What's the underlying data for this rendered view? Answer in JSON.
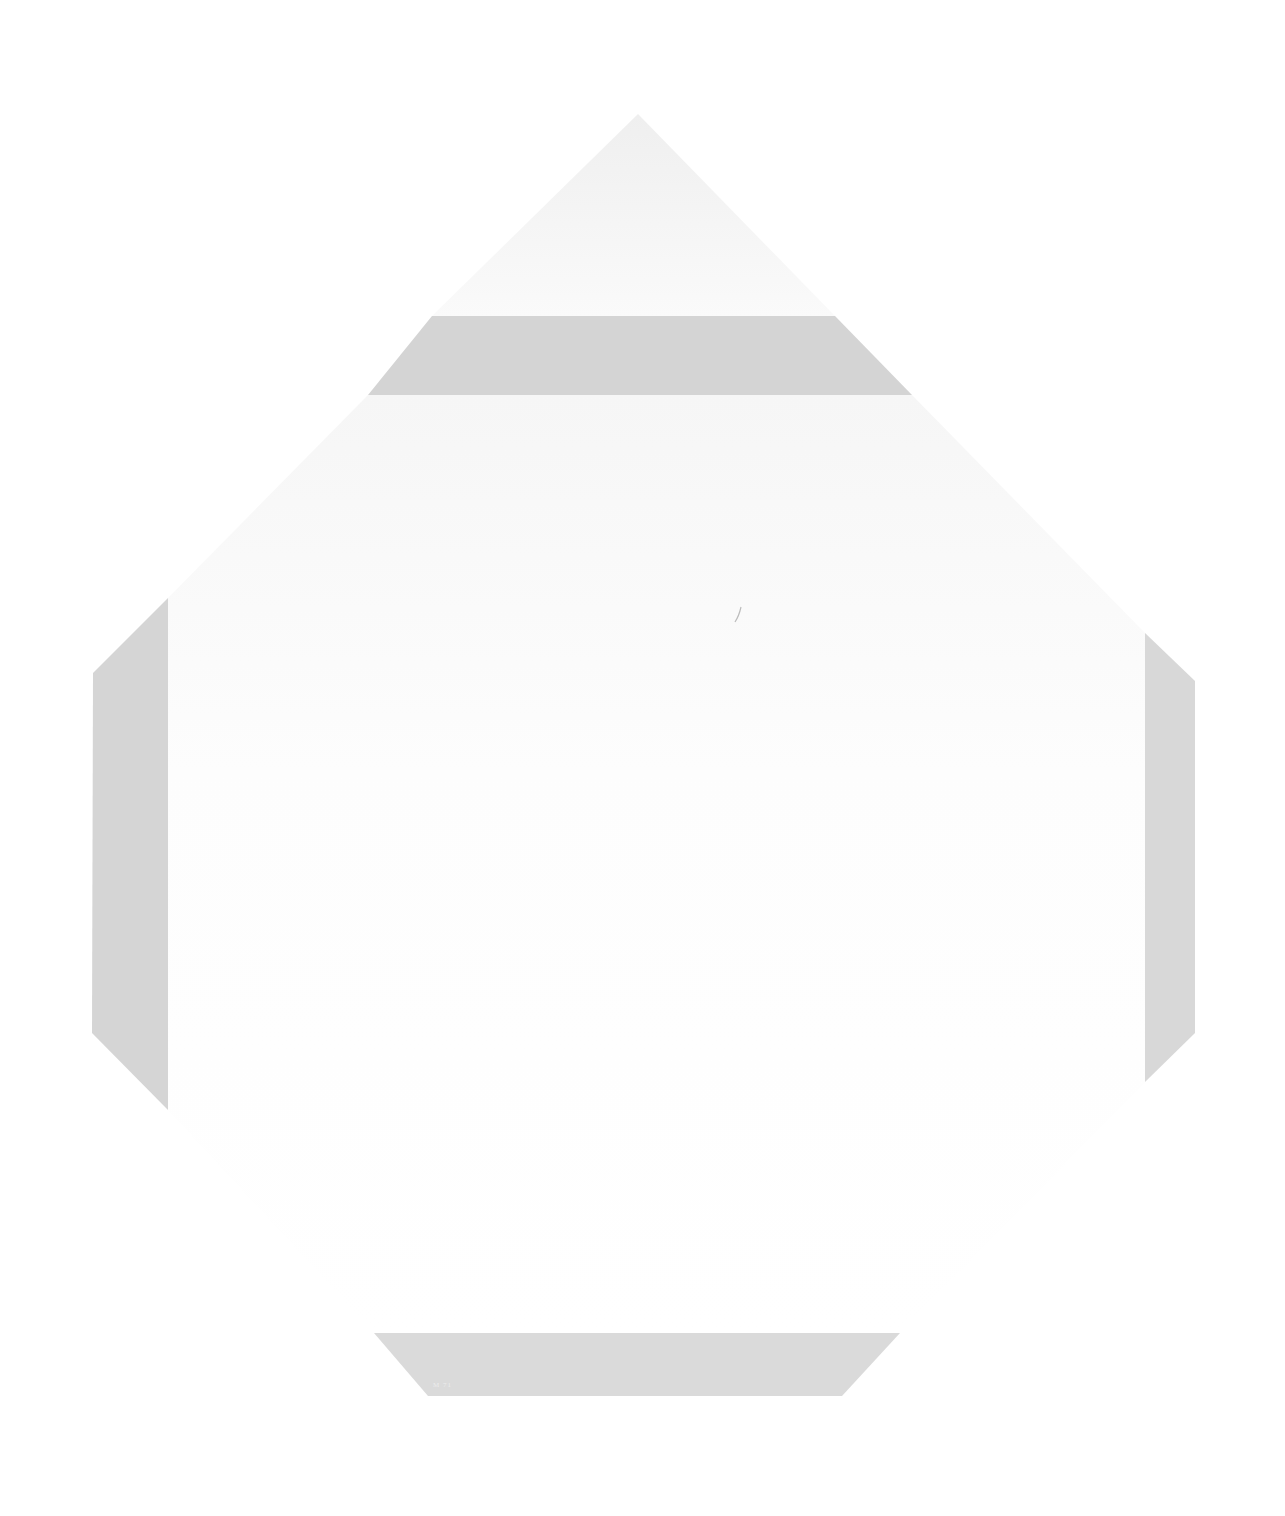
{
  "canvas": {
    "width": 1285,
    "height": 1516,
    "background": "#ffffff"
  },
  "colors": {
    "band": "#d6d6d6",
    "band_light": "#dadada",
    "ghost": "#f1f1f1",
    "ghost_fade": "#fbfbfb"
  },
  "shapes": {
    "ghost_triangle": "638,114 835,316 432,316",
    "ghost_body": "368,395 912,395 1145,633 1145,1082 900,1333 374,1333 168,1110 168,598",
    "top_band": "432,316 835,316 912,395 368,395",
    "left_band": "168,598 168,1110 92,1033 93,673",
    "right_band": "1145,633 1195,681 1195,1033 1145,1082",
    "bottom_band": "374,1333 900,1333 842,1396 428,1396"
  },
  "signature": "M 71"
}
